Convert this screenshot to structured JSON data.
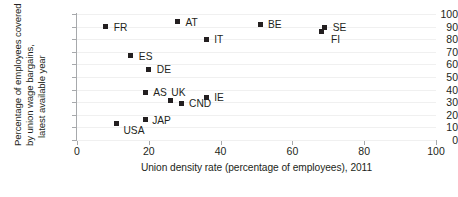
{
  "chart_data": {
    "type": "scatter",
    "title": "",
    "xlabel": "Union density rate (percentage of employees), 2011",
    "ylabel": "Percentage of employees covered by union wage bargains, latest available year",
    "ylabel_lines": [
      "Percentage of employees covered",
      "by union wage bargains,",
      "latest available year"
    ],
    "xlim": [
      0,
      100
    ],
    "ylim": [
      0,
      100
    ],
    "xticks": [
      0,
      20,
      40,
      60,
      80,
      100
    ],
    "yticks": [
      0,
      10,
      20,
      30,
      40,
      50,
      60,
      70,
      80,
      90,
      100
    ],
    "grid": true,
    "legend": "none",
    "marker_color": "#231f20",
    "axis_color": "#a7a9ac",
    "grid_color": "#f0f0f0",
    "points": [
      {
        "label": "FR",
        "x": 8,
        "y": 90,
        "label_dx": 8,
        "label_dy": -4
      },
      {
        "label": "AT",
        "x": 28,
        "y": 94,
        "label_dx": 8,
        "label_dy": -4
      },
      {
        "label": "IT",
        "x": 36,
        "y": 80,
        "label_dx": 8,
        "label_dy": -4
      },
      {
        "label": "BE",
        "x": 51,
        "y": 92,
        "label_dx": 8,
        "label_dy": -4
      },
      {
        "label": "SE",
        "x": 69,
        "y": 89,
        "label_dx": 8,
        "label_dy": -5
      },
      {
        "label": "FI",
        "x": 68,
        "y": 86,
        "label_dx": 10,
        "label_dy": 3
      },
      {
        "label": "ES",
        "x": 15,
        "y": 67,
        "label_dx": 8,
        "label_dy": -4
      },
      {
        "label": "DE",
        "x": 20,
        "y": 56,
        "label_dx": 8,
        "label_dy": -4
      },
      {
        "label": "AS",
        "x": 19,
        "y": 38,
        "label_dx": 8,
        "label_dy": -4
      },
      {
        "label": "IE",
        "x": 36,
        "y": 34,
        "label_dx": 8,
        "label_dy": -4
      },
      {
        "label": "UK",
        "x": 26,
        "y": 31,
        "label_dx": 1,
        "label_dy": -13
      },
      {
        "label": "CND",
        "x": 29,
        "y": 29,
        "label_dx": 8,
        "label_dy": -4
      },
      {
        "label": "USA",
        "x": 11,
        "y": 13,
        "label_dx": 7,
        "label_dy": 2
      },
      {
        "label": "JAP",
        "x": 19,
        "y": 16,
        "label_dx": 7,
        "label_dy": -4
      }
    ]
  }
}
